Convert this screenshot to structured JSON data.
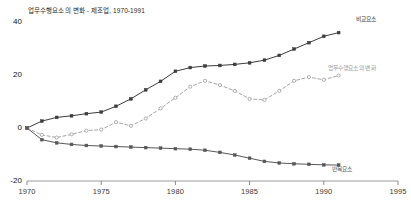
{
  "chart_data": {
    "type": "line",
    "title": "업무수행요소의 변화 - 제조업, 1970-1991",
    "xlabel": "",
    "ylabel": "",
    "xlim": [
      1970,
      1995
    ],
    "ylim": [
      -20,
      40
    ],
    "grid": false,
    "legend_position": "line-end-labels",
    "x_ticks": [
      "1970",
      "1975",
      "1980",
      "1985",
      "1990",
      "1995"
    ],
    "y_ticks": [
      "40",
      "20",
      "0",
      "-20"
    ],
    "x": [
      1970,
      1971,
      1972,
      1973,
      1974,
      1975,
      1976,
      1977,
      1978,
      1979,
      1980,
      1981,
      1982,
      1983,
      1984,
      1985,
      1986,
      1987,
      1988,
      1989,
      1990,
      1991
    ],
    "series": [
      {
        "name": "비교요소",
        "label": "비교요소",
        "style": "solid",
        "color": "#3c3c3c",
        "marker": "square",
        "values": [
          0.0,
          2.6,
          4.0,
          4.6,
          5.4,
          6.0,
          8.2,
          11.0,
          14.4,
          17.6,
          21.4,
          22.8,
          23.4,
          23.6,
          24.0,
          24.6,
          25.6,
          27.4,
          29.8,
          32.2,
          34.6,
          36.0
        ]
      },
      {
        "name": "업무수행요소의 변화",
        "label": "업무수행요소의 변화",
        "style": "dashed",
        "color": "#9a9a9a",
        "marker": "circle",
        "values": [
          0.0,
          -2.6,
          -3.6,
          -2.4,
          -1.0,
          -0.6,
          2.2,
          0.8,
          3.6,
          7.4,
          11.4,
          15.6,
          17.8,
          16.2,
          14.0,
          11.0,
          10.6,
          14.0,
          17.8,
          19.2,
          18.2,
          19.8
        ]
      },
      {
        "name": "반복요소",
        "label": "반복요소",
        "style": "solid",
        "color": "#575757",
        "marker": "square",
        "values": [
          0.0,
          -4.4,
          -5.6,
          -6.2,
          -6.6,
          -6.8,
          -7.0,
          -7.2,
          -7.4,
          -7.6,
          -7.8,
          -8.0,
          -8.4,
          -9.2,
          -10.2,
          -11.4,
          -12.6,
          -13.2,
          -13.5,
          -13.7,
          -13.9,
          -14.0
        ]
      }
    ]
  },
  "axes": {
    "axis_color": "#9a9a9a",
    "tick_color": "#8a8a8a"
  },
  "series_labels": [
    {
      "text": "비교요소",
      "x": 356,
      "y": 15
    },
    {
      "text": "업무수행요소의 변화",
      "x": 328,
      "y": 64
    },
    {
      "text": "반복요소",
      "x": 332,
      "y": 165
    }
  ]
}
